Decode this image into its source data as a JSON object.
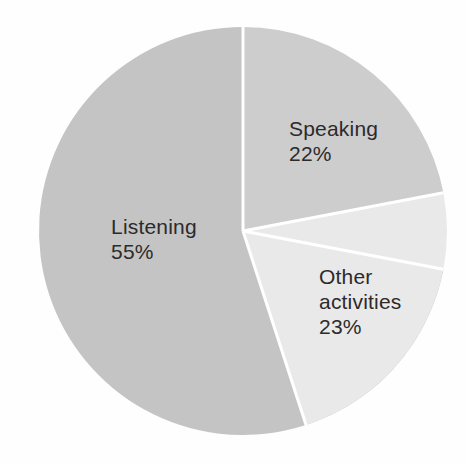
{
  "chart_data": {
    "type": "pie",
    "title": "",
    "subtitle": "",
    "xlabel": "",
    "ylabel": "",
    "legend_position": "none",
    "grid": false,
    "labels_inside_slices": true,
    "categories": [
      "Listening",
      "Speaking",
      "Other activities"
    ],
    "values": [
      55,
      22,
      23
    ],
    "value_unit": "%",
    "start_angle_deg": 0,
    "direction": "clockwise",
    "slices": [
      {
        "name": "Listening",
        "value": 55,
        "value_label": "55%",
        "color": "#c4c4c4",
        "start_angle_deg": 100.8,
        "end_angle_deg": 360
      },
      {
        "name": "Speaking",
        "value": 22,
        "value_label": "22%",
        "color": "#cdcdcd",
        "start_angle_deg": 0,
        "end_angle_deg": 79.2
      },
      {
        "name": "Other activities",
        "value": 23,
        "value_label": "23%",
        "color": "#e9e9e9",
        "start_angle_deg": 79.2,
        "end_angle_deg": 162
      }
    ],
    "geometry": {
      "center_x": 243,
      "center_y": 231,
      "radius": 204,
      "divider_color": "#ffffff",
      "divider_width": 3
    },
    "background_color": "#fefefe",
    "text_color": "#2b2b2b"
  },
  "labels": {
    "speaking": "Speaking\n22%",
    "listening": "Listening\n55%",
    "other": "Other\nactivities\n23%"
  },
  "accessibility": {
    "chart_description": "Pie chart showing Listening 55%, Speaking 22%, Other activities 23%"
  }
}
